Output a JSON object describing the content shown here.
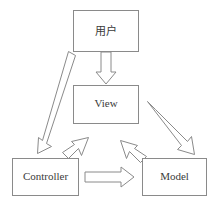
{
  "diagram": {
    "type": "block-arrow-flow",
    "background_color": "#ffffff",
    "line_color": "#8a8a8a",
    "text_color": "#3a3a3a",
    "nodes": [
      {
        "id": "user",
        "label": "用户",
        "shape": "rectangle",
        "x": 73,
        "y": 10,
        "width": 65,
        "height": 41
      },
      {
        "id": "view",
        "label": "View",
        "shape": "rectangle",
        "x": 73,
        "y": 85,
        "width": 65,
        "height": 38
      },
      {
        "id": "controller",
        "label": "Controller",
        "shape": "rectangle",
        "x": 12,
        "y": 158,
        "width": 66,
        "height": 37
      },
      {
        "id": "model",
        "label": "Model",
        "shape": "rectangle",
        "x": 142,
        "y": 158,
        "width": 64,
        "height": 37
      }
    ],
    "edges": [
      {
        "id": "user-to-view",
        "from": "user",
        "to": "view",
        "style": "hollow-block-arrow",
        "direction": "down"
      },
      {
        "id": "user-to-controller",
        "from": "user",
        "to": "controller",
        "style": "hollow-block-arrow",
        "direction": "down-left"
      },
      {
        "id": "controller-to-view",
        "from": "controller",
        "to": "view",
        "style": "hollow-block-arrow",
        "direction": "up-right"
      },
      {
        "id": "model-to-view",
        "from": "model",
        "to": "view",
        "style": "hollow-block-arrow",
        "direction": "up-left"
      },
      {
        "id": "view-to-model",
        "from": "view",
        "to": "model",
        "style": "hollow-block-arrow",
        "direction": "down-right"
      },
      {
        "id": "controller-to-model",
        "from": "controller",
        "to": "model",
        "style": "hollow-block-arrow",
        "direction": "right"
      }
    ]
  }
}
